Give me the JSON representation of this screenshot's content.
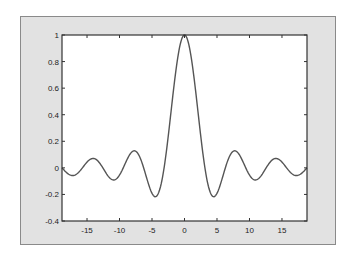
{
  "chart_data": {
    "type": "line",
    "title": "",
    "xlabel": "",
    "ylabel": "",
    "function": "sin(x)/x",
    "xlim": [
      -18.85,
      18.85
    ],
    "ylim": [
      -0.4,
      1
    ],
    "grid": false,
    "legend": null,
    "x_ticks": [
      -15,
      -10,
      -5,
      0,
      5,
      10,
      15
    ],
    "x_tick_labels": [
      "-15",
      "-10",
      "-5",
      "0",
      "5",
      "10",
      "15"
    ],
    "y_ticks": [
      -0.4,
      -0.2,
      0,
      0.2,
      0.4,
      0.6,
      0.8,
      1
    ],
    "y_tick_labels": [
      "-0.4",
      "-0.2",
      "0",
      "0.2",
      "0.4",
      "0.6",
      "0.8",
      "1"
    ],
    "series": [
      {
        "name": "sinc",
        "color": "#555555",
        "x": [
          -18.85,
          -17.5,
          -16.5,
          -15.5,
          -14.14,
          -13,
          -12,
          -11,
          -10.9,
          -10,
          -9,
          -7.73,
          -7,
          -6,
          -5,
          -4.49,
          -4,
          -3,
          -2,
          -1,
          0,
          1,
          2,
          3,
          4,
          4.49,
          5,
          6,
          7,
          7.73,
          9,
          10,
          10.9,
          11,
          12,
          13,
          14.14,
          15.5,
          16.5,
          17.5,
          18.85
        ],
        "y": [
          0,
          -0.056,
          -0.043,
          0.012,
          0.07,
          0.032,
          -0.045,
          -0.091,
          -0.091,
          -0.054,
          0.046,
          0.128,
          0.094,
          -0.047,
          -0.192,
          -0.217,
          -0.189,
          0.047,
          0.455,
          0.841,
          1,
          0.841,
          0.455,
          0.047,
          -0.189,
          -0.217,
          -0.192,
          -0.047,
          0.094,
          0.128,
          0.046,
          -0.054,
          -0.091,
          -0.091,
          -0.045,
          0.032,
          0.07,
          0.012,
          -0.043,
          -0.056,
          0
        ]
      }
    ]
  },
  "colors": {
    "figure_background": "#e2e2e2",
    "axes_background": "#ffffff",
    "axes_line": "#333333",
    "line": "#555555"
  }
}
